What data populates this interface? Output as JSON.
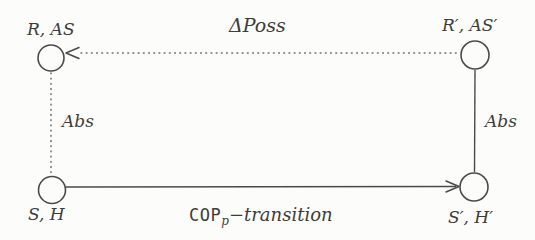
{
  "diagram": {
    "type": "state-transition-square-diagram",
    "colors": {
      "background": "#fcfcfa",
      "line_color": "#4a4a4a",
      "dotted_color": "#6e6e6e",
      "text_color": "#3c3c3c"
    },
    "nodes": [
      {
        "id": "top-left",
        "label": "R, AS"
      },
      {
        "id": "top-right",
        "label": "R′, AS′"
      },
      {
        "id": "bottom-left",
        "label": "S, H"
      },
      {
        "id": "bottom-right",
        "label": "S′, H′"
      }
    ],
    "edges": [
      {
        "id": "top",
        "label": "ΔPoss",
        "style": "dotted",
        "direction": "right-to-left"
      },
      {
        "id": "left",
        "label": "Abs",
        "style": "dotted",
        "direction": "none"
      },
      {
        "id": "right",
        "label": "Abs",
        "style": "solid",
        "direction": "none"
      },
      {
        "id": "bottom",
        "label_cop": "COP",
        "label_sub": "p",
        "label_rest": "−transition",
        "style": "solid",
        "direction": "left-to-right"
      }
    ]
  }
}
